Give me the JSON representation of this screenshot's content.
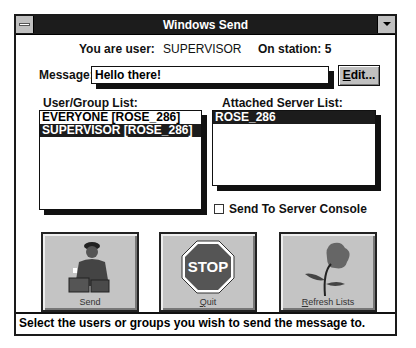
{
  "window": {
    "title": "Windows Send"
  },
  "header": {
    "user_label": "You are user:",
    "user_value": "SUPERVISOR",
    "station_label": "On station: 5"
  },
  "message": {
    "label": "Message:",
    "value": "Hello there!",
    "edit_button": "Edit..."
  },
  "user_group_list": {
    "label": "User/Group List:",
    "items": [
      {
        "text": "EVERYONE [ROSE_286]",
        "selected": false
      },
      {
        "text": "SUPERVISOR [ROSE_286]",
        "selected": true
      }
    ]
  },
  "server_list": {
    "label": "Attached Server List:",
    "items": [
      {
        "text": "ROSE_286",
        "selected": true
      }
    ]
  },
  "console_checkbox": {
    "label": "Send To Server Console",
    "checked": false
  },
  "buttons": {
    "send": {
      "label": "Send",
      "icon": "courier-icon"
    },
    "quit": {
      "label": "Quit",
      "icon": "stop-sign-icon",
      "sign_text": "STOP"
    },
    "refresh": {
      "label": "Refresh Lists",
      "icon": "flower-icon"
    }
  },
  "status_bar": {
    "text": "Select the users or groups you wish to send the message to."
  }
}
